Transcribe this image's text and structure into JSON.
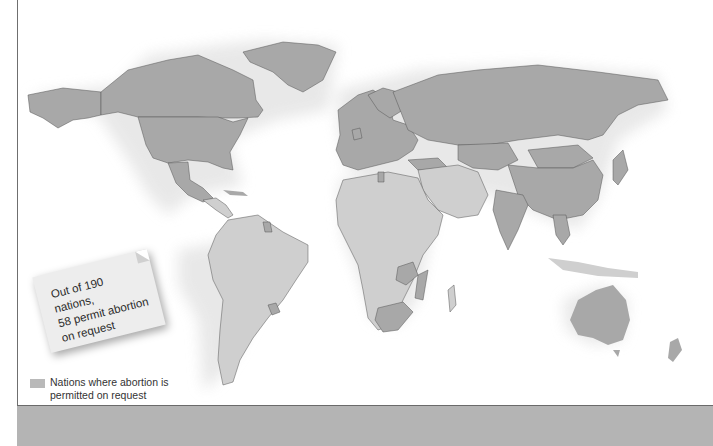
{
  "figure": {
    "type": "choropleth world map",
    "colors": {
      "permitted_on_request": "#a5a5a5",
      "not_permitted_on_request": "#cfcfcf",
      "ocean": "#ffffff",
      "border": "#555555",
      "bottom_band": "#b4b4b4"
    }
  },
  "callout": {
    "line1": "Out of 190 nations,",
    "line2": "58 permit abortion",
    "line3": "on request"
  },
  "legend": {
    "items": [
      {
        "label": "Nations where abortion is permitted on request",
        "color": "#b9b9b9"
      }
    ]
  },
  "stats": {
    "total_nations": 190,
    "permit_on_request": 58
  },
  "regions_shaded_permitted": [
    "North America (Canada, United States, Greenland)",
    "Mexico City region",
    "Cuba",
    "Guyana",
    "Uruguay",
    "Europe (most)",
    "Russia",
    "Central Asia",
    "Mongolia",
    "China",
    "India",
    "Southeast Asia (Vietnam, Cambodia)",
    "Tunisia",
    "Turkey",
    "Zambia",
    "Mozambique",
    "South Africa",
    "Australia"
  ]
}
